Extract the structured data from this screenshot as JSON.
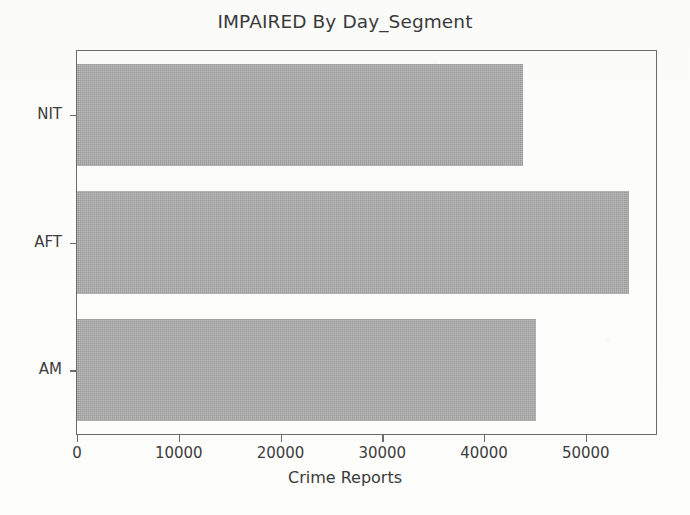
{
  "chart_data": {
    "type": "bar",
    "orientation": "horizontal",
    "title": "IMPAIRED By Day_Segment",
    "xlabel": "Crime Reports",
    "ylabel": "",
    "categories": [
      "NIT",
      "AFT",
      "AM"
    ],
    "values": [
      43800,
      54200,
      45100
    ],
    "series": [
      {
        "name": "Crime Reports",
        "values": [
          43800,
          54200,
          45100
        ]
      }
    ],
    "xlim": [
      0,
      56900
    ],
    "xticks": [
      0,
      10000,
      20000,
      30000,
      40000,
      50000
    ],
    "xtick_labels": [
      "0",
      "10000",
      "20000",
      "30000",
      "40000",
      "50000"
    ],
    "ytick_labels": [
      "NIT",
      "AFT",
      "AM"
    ],
    "grid": false,
    "legend": false,
    "legend_position": "none",
    "bar_color": "#a9a9a9",
    "axis_color": "#6b6b6b",
    "text_color": "#3a3a3a",
    "background": "#fdfdfc"
  }
}
